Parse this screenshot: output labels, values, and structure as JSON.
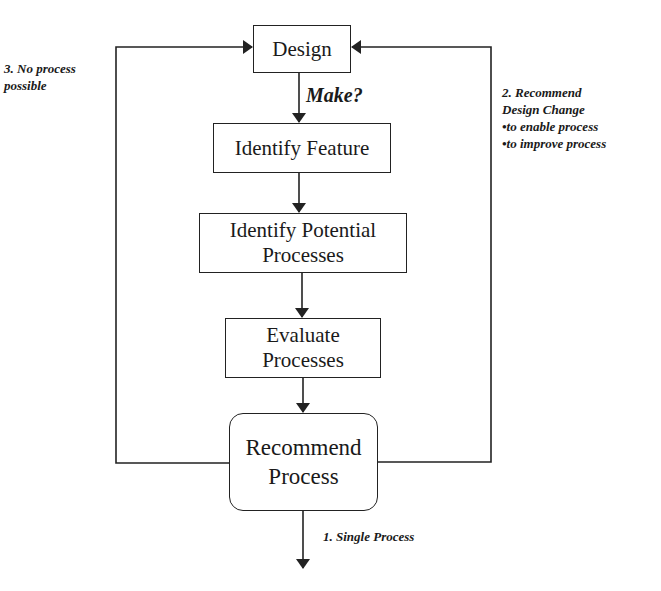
{
  "diagram": {
    "type": "flowchart",
    "nodes": [
      {
        "id": "design",
        "lines": [
          "Design"
        ]
      },
      {
        "id": "identify_feature",
        "lines": [
          "Identify Feature"
        ]
      },
      {
        "id": "identify_potential",
        "lines": [
          "Identify Potential",
          "Processes"
        ]
      },
      {
        "id": "evaluate",
        "lines": [
          "Evaluate",
          "Processes"
        ]
      },
      {
        "id": "recommend",
        "lines": [
          "Recommend",
          "Process"
        ]
      }
    ],
    "edge_labels": {
      "make": "Make?",
      "no_process": [
        "3. No process",
        "possible"
      ],
      "recommend_change": [
        "2. Recommend",
        "Design Change",
        "•to enable process",
        "•to improve process"
      ],
      "single_process": "1. Single Process"
    },
    "edges": [
      {
        "from": "design",
        "to": "identify_feature",
        "label": "Make?"
      },
      {
        "from": "identify_feature",
        "to": "identify_potential"
      },
      {
        "from": "identify_potential",
        "to": "evaluate"
      },
      {
        "from": "evaluate",
        "to": "recommend"
      },
      {
        "from": "recommend",
        "to": "design",
        "side": "left",
        "label": "3. No process possible"
      },
      {
        "from": "recommend",
        "to": "design",
        "side": "right",
        "label": "2. Recommend Design Change"
      },
      {
        "from": "recommend",
        "to": "output",
        "label": "1. Single Process"
      }
    ],
    "colors": {
      "stroke": "#222222",
      "text": "#1a1a1a",
      "background": "#ffffff"
    }
  }
}
